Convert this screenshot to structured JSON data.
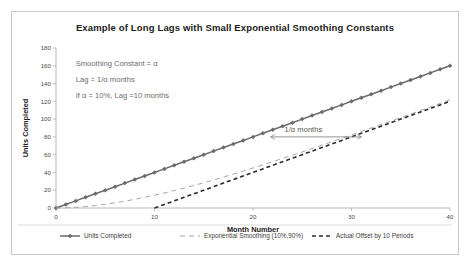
{
  "chart_data": {
    "type": "line",
    "title": "Example of Long Lags with Small Exponential Smoothing Constants",
    "xlabel": "Month Number",
    "ylabel": "Units Completed",
    "xlim": [
      0,
      40
    ],
    "ylim": [
      0,
      180
    ],
    "xticks": [
      0,
      10,
      20,
      30,
      40
    ],
    "yticks": [
      0,
      20,
      40,
      60,
      80,
      100,
      120,
      140,
      160,
      180
    ],
    "grid": false,
    "legend_position": "bottom",
    "x": [
      0,
      1,
      2,
      3,
      4,
      5,
      6,
      7,
      8,
      9,
      10,
      11,
      12,
      13,
      14,
      15,
      16,
      17,
      18,
      19,
      20,
      21,
      22,
      23,
      24,
      25,
      26,
      27,
      28,
      29,
      30,
      31,
      32,
      33,
      34,
      35,
      36,
      37,
      38,
      39,
      40
    ],
    "series": [
      {
        "name": "Units Completed",
        "style": "solid-with-markers",
        "color": "#6b6b6b",
        "values": [
          0,
          4,
          8,
          12,
          16,
          20,
          24,
          28,
          32,
          36,
          40,
          44,
          48,
          52,
          56,
          60,
          64,
          68,
          72,
          76,
          80,
          84,
          88,
          92,
          96,
          100,
          104,
          108,
          112,
          116,
          120,
          124,
          128,
          132,
          136,
          140,
          144,
          148,
          152,
          156,
          160
        ]
      },
      {
        "name": "Exponential Smoothing (10%,90%)",
        "style": "dashed-thin",
        "color": "#a8a8a8",
        "values": [
          0,
          0.2,
          0.76,
          1.63,
          2.78,
          4.2,
          5.85,
          7.71,
          9.77,
          12.0,
          14.4,
          16.9,
          19.6,
          22.4,
          25.4,
          28.4,
          31.5,
          34.8,
          38.1,
          41.5,
          45.0,
          48.5,
          52.1,
          55.7,
          59.4,
          63.1,
          66.9,
          70.7,
          74.5,
          78.3,
          82.2,
          86.1,
          90.0,
          93.9,
          97.8,
          101.8,
          105.8,
          109.7,
          113.7,
          117.7,
          121.7
        ]
      },
      {
        "name": "Actual Offset by 10 Periods",
        "style": "dashed-bold",
        "color": "#2b2b2b",
        "values": [
          null,
          null,
          null,
          null,
          null,
          null,
          null,
          null,
          null,
          null,
          0,
          4,
          8,
          12,
          16,
          20,
          24,
          28,
          32,
          36,
          40,
          44,
          48,
          52,
          56,
          60,
          64,
          68,
          72,
          76,
          80,
          84,
          88,
          92,
          96,
          100,
          104,
          108,
          112,
          116,
          120
        ]
      }
    ],
    "annotations": [
      {
        "name": "smoothing-constant",
        "text": "Smoothing Constant = α",
        "x": 2.0,
        "y": 160
      },
      {
        "name": "lag-formula",
        "text": "Lag = 1/α months",
        "x": 2.0,
        "y": 142
      },
      {
        "name": "lag-example",
        "text": "If α = 10%, Lag =10 months",
        "x": 2.0,
        "y": 124
      },
      {
        "name": "lag-arrow-label",
        "text": "1/α months",
        "x": 23.2,
        "y": 86
      }
    ],
    "arrow": {
      "name": "lag-arrow",
      "x_start": 21.8,
      "x_end": 31.0,
      "y": 80
    }
  },
  "legend": {
    "items": [
      {
        "label": "Units Completed",
        "style": "solid-with-markers"
      },
      {
        "label": "Exponential Smoothing (10%,90%)",
        "style": "dashed-thin"
      },
      {
        "label": "Actual Offset by 10 Periods",
        "style": "dashed-bold"
      }
    ]
  }
}
